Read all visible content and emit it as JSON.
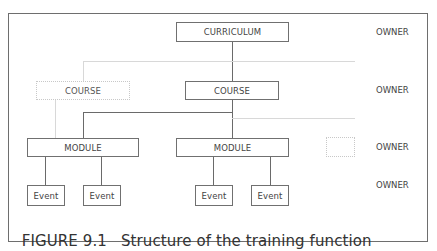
{
  "figure": {
    "caption_number": "FIGURE 9.1",
    "caption_text": "Structure of the training function"
  },
  "nodes": {
    "curriculum": "CURRICULUM",
    "course_left": "COURSE",
    "course_center": "COURSE",
    "module_left": "MODULE",
    "module_center": "MODULE",
    "events": [
      "Event",
      "Event",
      "Event",
      "Event"
    ]
  },
  "owner_labels": [
    "OWNER",
    "OWNER",
    "OWNER",
    "OWNER"
  ]
}
